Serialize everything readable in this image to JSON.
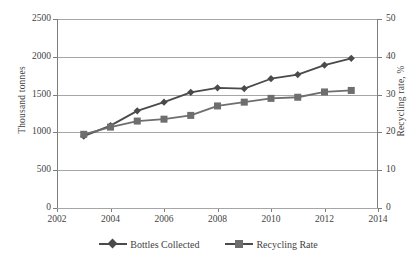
{
  "chart_data": {
    "type": "line",
    "title": "",
    "xlabel": "",
    "ylabel": "Thousand tonnes",
    "y2label": "Recycling rate, %",
    "grid": true,
    "legend_position": "bottom",
    "x": [
      2003,
      2004,
      2005,
      2006,
      2007,
      2008,
      2009,
      2010,
      2011,
      2012,
      2013
    ],
    "xlim": [
      2002,
      2014
    ],
    "x_ticks": [
      "2002",
      "2004",
      "2006",
      "2008",
      "2010",
      "2012",
      "2014"
    ],
    "x_tick_values": [
      2002,
      2004,
      2006,
      2008,
      2010,
      2012,
      2014
    ],
    "ylim": [
      0,
      2500
    ],
    "y_ticks": [
      "0",
      "500",
      "1000",
      "1500",
      "2000",
      "2500"
    ],
    "y_tick_values": [
      0,
      500,
      1000,
      1500,
      2000,
      2500
    ],
    "y2lim": [
      0,
      50
    ],
    "y2_ticks": [
      "0",
      "10",
      "20",
      "30",
      "40",
      "50"
    ],
    "y2_tick_values": [
      0,
      10,
      20,
      30,
      40,
      50
    ],
    "series": [
      {
        "name": "Bottles Collected",
        "axis": "left",
        "marker": "diamond",
        "color": "#4a4a4a",
        "values": [
          950,
          1090,
          1285,
          1400,
          1530,
          1590,
          1580,
          1710,
          1765,
          1890,
          1980
        ]
      },
      {
        "name": "Recycling Rate",
        "axis": "right",
        "marker": "square",
        "color": "#6e6e6e",
        "values": [
          19.5,
          21.4,
          23.0,
          23.5,
          24.5,
          27.0,
          28.0,
          29.0,
          29.3,
          30.7,
          31.1
        ]
      }
    ]
  },
  "legend": {
    "items": [
      {
        "label": "Bottles Collected",
        "marker": "diamond-marker"
      },
      {
        "label": "Recycling Rate",
        "marker": "square-marker"
      }
    ]
  },
  "colors": {
    "series_1": "#4a4a4a",
    "series_2": "#6e6e6e",
    "grid": "#a6a6a6",
    "axis": "#7d7d7d",
    "text": "#3f3f3f",
    "background": "#ffffff"
  }
}
